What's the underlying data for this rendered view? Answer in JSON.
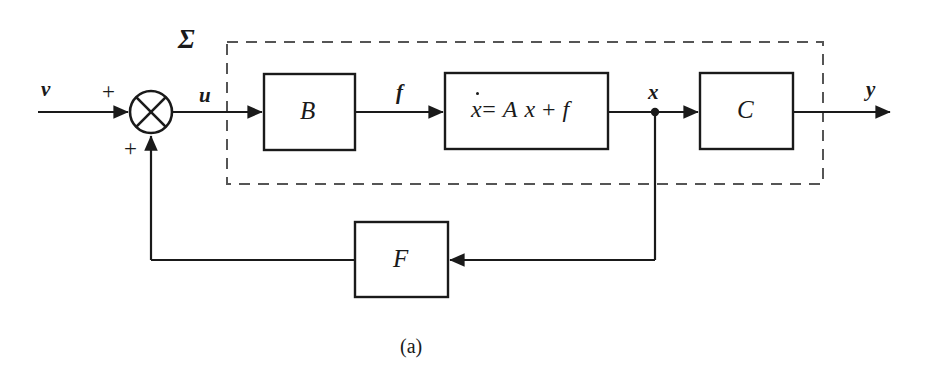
{
  "figure": {
    "caption": "(a)",
    "system_label": "Σ"
  },
  "signals": {
    "input": "v",
    "control": "u",
    "force": "f",
    "state": "x",
    "output": "y"
  },
  "summing_junction": {
    "name": "summing-junction",
    "sign_top": "+",
    "sign_bottom": "+"
  },
  "blocks": [
    {
      "id": "b",
      "label": "B"
    },
    {
      "id": "state",
      "label": "ẋ = A x + f",
      "lhs": "ẋ",
      "eq": "=",
      "rhs_a": "A",
      "rhs_x": "x",
      "rhs_plus": "+",
      "rhs_f": "f"
    },
    {
      "id": "c",
      "label": "C"
    },
    {
      "id": "f",
      "label": "F"
    }
  ],
  "colors": {
    "ink": "#1a1a1a",
    "background": "#ffffff",
    "dashed": "#555555"
  }
}
